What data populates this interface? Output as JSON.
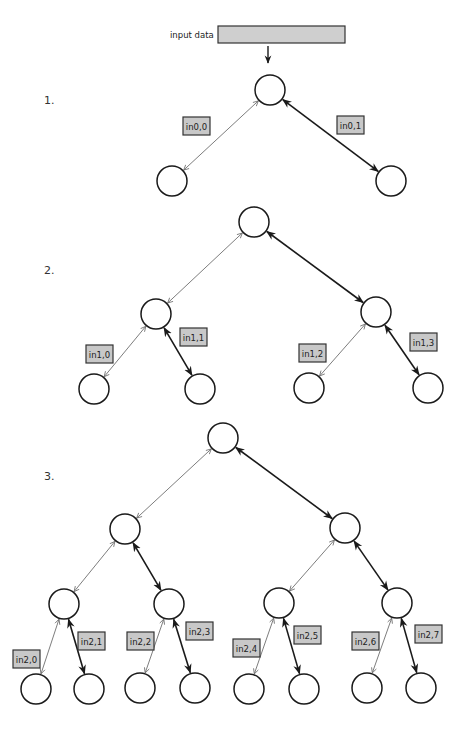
{
  "input": {
    "label": "input data"
  },
  "colors": {
    "label_fill": "#c8c8c8",
    "input_fill": "#cfcfcf",
    "thin_edge": "#6e6e6e",
    "thick_edge": "#1a1a1a"
  },
  "steps": [
    {
      "number": "1.",
      "levels": 2,
      "edge_labels": [
        {
          "text": "in0,0",
          "edge": "root-left"
        },
        {
          "text": "in0,1",
          "edge": "root-right"
        }
      ]
    },
    {
      "number": "2.",
      "levels": 3,
      "edge_labels": [
        {
          "text": "in1,0"
        },
        {
          "text": "in1,1"
        },
        {
          "text": "in1,2"
        },
        {
          "text": "in1,3"
        }
      ]
    },
    {
      "number": "3.",
      "levels": 4,
      "edge_labels": [
        {
          "text": "in2,0"
        },
        {
          "text": "in2,1"
        },
        {
          "text": "in2,2"
        },
        {
          "text": "in2,3"
        },
        {
          "text": "in2,4"
        },
        {
          "text": "in2,5"
        },
        {
          "text": "in2,6"
        },
        {
          "text": "in2,7"
        }
      ]
    }
  ],
  "legend": {
    "thin_edge_meaning": "left child connection (open arrowheads)",
    "thick_edge_meaning": "right child connection (filled arrowheads)"
  }
}
